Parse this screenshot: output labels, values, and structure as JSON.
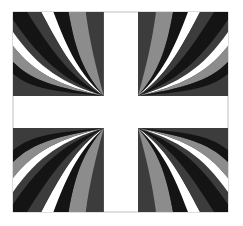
{
  "artwork": {
    "description": "Abstract cross design with four quadrants of wavy radiating stripes",
    "colors": {
      "background": "#ffffff",
      "dark": "#3c3c3c",
      "black": "#141414",
      "gray": "#8c8c8c",
      "white": "#ffffff",
      "frame": "#bdbdbd"
    },
    "quadrants": [
      {
        "id": "top-left",
        "x": 13,
        "y": 12,
        "width": 91,
        "height": 84,
        "focus": "bottom-right"
      },
      {
        "id": "top-right",
        "x": 138,
        "y": 12,
        "width": 90,
        "height": 84,
        "focus": "bottom-left"
      },
      {
        "id": "bottom-left",
        "x": 13,
        "y": 128,
        "width": 91,
        "height": 84,
        "focus": "top-right"
      },
      {
        "id": "bottom-right",
        "x": 138,
        "y": 128,
        "width": 90,
        "height": 84,
        "focus": "top-left"
      }
    ]
  }
}
